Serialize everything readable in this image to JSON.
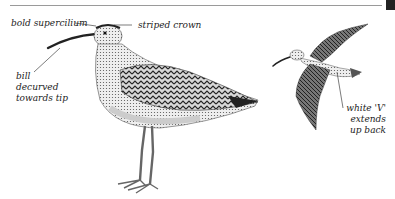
{
  "figure": {
    "subjects": [
      {
        "name": "standing-bird",
        "description": "Standing wader illustration (side view)"
      },
      {
        "name": "flying-bird",
        "description": "Wader in flight illustration"
      }
    ],
    "labels": {
      "supercilium": "bold supercilium",
      "crown": "striped crown",
      "bill_line1": "bill",
      "bill_line2": "decurved",
      "bill_line3": "towards tip",
      "back_line1": "white 'V'",
      "back_line2": "extends",
      "back_line3": "up back"
    },
    "colors": {
      "ink": "#222222",
      "rule": "#9a9a9a",
      "background": "#ffffff"
    }
  }
}
